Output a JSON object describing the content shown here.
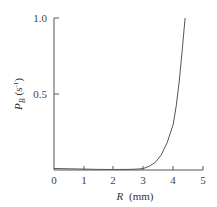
{
  "chart_data": {
    "type": "line",
    "title": "",
    "xlabel": "R (mm)",
    "ylabel": "P_B (s^-1)",
    "xlim": [
      0,
      5
    ],
    "ylim": [
      0,
      1.0
    ],
    "xticks": [
      "0",
      "1",
      "2",
      "3",
      "4",
      "5"
    ],
    "yticks": [
      "0.5",
      "1.0"
    ],
    "grid": false,
    "legend": null,
    "series": [
      {
        "name": "P_B",
        "x": [
          0,
          0.5,
          1.0,
          1.5,
          2.0,
          2.5,
          2.8,
          3.0,
          3.2,
          3.4,
          3.6,
          3.8,
          4.0,
          4.1,
          4.2,
          4.3,
          4.4
        ],
        "y": [
          0.01,
          0.008,
          0.006,
          0.004,
          0.003,
          0.004,
          0.006,
          0.01,
          0.025,
          0.05,
          0.1,
          0.18,
          0.3,
          0.42,
          0.58,
          0.78,
          1.0
        ]
      }
    ]
  },
  "axes": {
    "x_label_main": "R",
    "x_label_unit": "(mm)",
    "y_label_main": "P",
    "y_label_sub": "B",
    "y_label_unit_open": "(s",
    "y_label_unit_sup": "-1",
    "y_label_unit_close": ")",
    "x_ticks": [
      "0",
      "1",
      "2",
      "3",
      "4",
      "5"
    ],
    "y_ticks": [
      "0.5",
      "1.0"
    ]
  }
}
